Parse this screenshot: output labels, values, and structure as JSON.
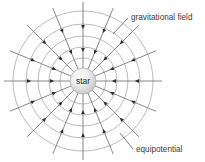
{
  "figure": {
    "title": "",
    "background_color": "#ffffff",
    "width": 205,
    "height": 162
  },
  "labels": {
    "center": "star",
    "field_lines": "gravitational field",
    "equipotential": "equipotential"
  },
  "colors": {
    "ray_line": "#6b6b6b",
    "circle_line": "#9c9c9c",
    "arrow_marker": "#2d2d2d",
    "leader_line": "#555555",
    "text": "#3c3c3c",
    "star_fill_inner": "#f2f2f2",
    "star_fill_outer": "#c9c9c9",
    "star_stroke": "#a8a8a8"
  },
  "chart_data": {
    "type": "diagram",
    "center": {
      "x": 83,
      "y": 81,
      "label": "star",
      "radius": 13
    },
    "radial_field_lines": {
      "name": "gravitational field",
      "count": 16,
      "angle_step_degrees": 22.5,
      "inner_radius": 13,
      "outer_radius": 79,
      "direction": "inward (toward star)",
      "arrow_radii": [
        32,
        55
      ]
    },
    "equipotential_circles": {
      "name": "equipotential",
      "count": 5,
      "radii": [
        23,
        34,
        45,
        57,
        70
      ]
    },
    "annotations": [
      {
        "text": "gravitational field",
        "x": 130,
        "y": 18,
        "leader_to_x": 117,
        "leader_to_y": 31
      },
      {
        "text": "equipotential",
        "x": 135,
        "y": 151,
        "leader_to_x": 124,
        "leader_to_y": 135
      }
    ]
  }
}
